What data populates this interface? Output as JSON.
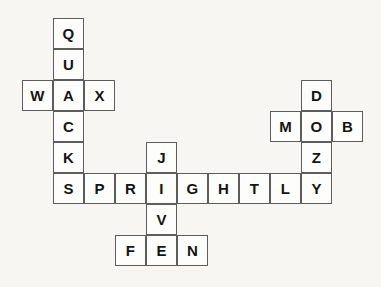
{
  "puzzle": {
    "type": "crossword-grid",
    "title": "Pangram crossword grid",
    "cell_size_px": 31,
    "origin_x_px": 22,
    "origin_y_px": 18,
    "columns": 11,
    "rows": 8,
    "background_color": "#f7f6f3",
    "cell_fill_color": "#fdfdfb",
    "cell_border_color": "#5d5d5d",
    "letter_color": "#141414",
    "words": {
      "across": [
        "WAX",
        "SPRIGHTLY",
        "MOB",
        "FEN"
      ],
      "down": [
        "QUACKS",
        "DOZY",
        "JIVE"
      ]
    },
    "cells": [
      {
        "letter": "Q",
        "col": 1,
        "row": 0
      },
      {
        "letter": "U",
        "col": 1,
        "row": 1
      },
      {
        "letter": "W",
        "col": 0,
        "row": 2
      },
      {
        "letter": "A",
        "col": 1,
        "row": 2
      },
      {
        "letter": "X",
        "col": 2,
        "row": 2
      },
      {
        "letter": "C",
        "col": 1,
        "row": 3
      },
      {
        "letter": "K",
        "col": 1,
        "row": 4
      },
      {
        "letter": "J",
        "col": 4,
        "row": 4
      },
      {
        "letter": "S",
        "col": 1,
        "row": 5
      },
      {
        "letter": "P",
        "col": 2,
        "row": 5
      },
      {
        "letter": "R",
        "col": 3,
        "row": 5
      },
      {
        "letter": "I",
        "col": 4,
        "row": 5
      },
      {
        "letter": "G",
        "col": 5,
        "row": 5
      },
      {
        "letter": "H",
        "col": 6,
        "row": 5
      },
      {
        "letter": "T",
        "col": 7,
        "row": 5
      },
      {
        "letter": "L",
        "col": 8,
        "row": 5
      },
      {
        "letter": "Y",
        "col": 9,
        "row": 5
      },
      {
        "letter": "V",
        "col": 4,
        "row": 6
      },
      {
        "letter": "F",
        "col": 3,
        "row": 7
      },
      {
        "letter": "E",
        "col": 4,
        "row": 7
      },
      {
        "letter": "N",
        "col": 5,
        "row": 7
      },
      {
        "letter": "D",
        "col": 9,
        "row": 2
      },
      {
        "letter": "M",
        "col": 8,
        "row": 3
      },
      {
        "letter": "O",
        "col": 9,
        "row": 3
      },
      {
        "letter": "B",
        "col": 10,
        "row": 3
      },
      {
        "letter": "Z",
        "col": 9,
        "row": 4
      }
    ]
  }
}
